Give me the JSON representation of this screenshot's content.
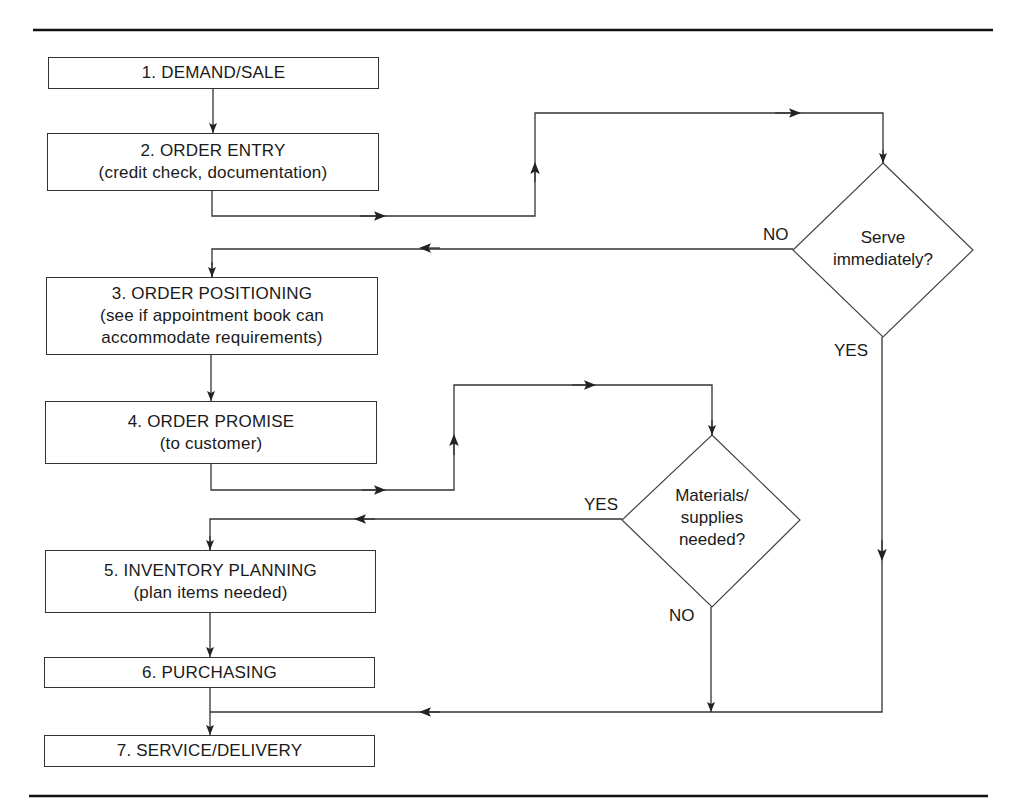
{
  "diagram": {
    "type": "flowchart",
    "steps": [
      {
        "id": 1,
        "title": "1. DEMAND/SALE",
        "subtitle": ""
      },
      {
        "id": 2,
        "title": "2. ORDER ENTRY",
        "subtitle": "(credit check, documentation)"
      },
      {
        "id": 3,
        "title": "3. ORDER POSITIONING",
        "subtitle_line1": "(see if appointment book can",
        "subtitle_line2": "accommodate requirements)"
      },
      {
        "id": 4,
        "title": "4. ORDER PROMISE",
        "subtitle": "(to customer)"
      },
      {
        "id": 5,
        "title": "5. INVENTORY PLANNING",
        "subtitle": "(plan items needed)"
      },
      {
        "id": 6,
        "title": "6. PURCHASING",
        "subtitle": ""
      },
      {
        "id": 7,
        "title": "7. SERVICE/DELIVERY",
        "subtitle": ""
      }
    ],
    "decisions": [
      {
        "id": "serve",
        "line1": "Serve",
        "line2": "immediately?",
        "no_label": "NO",
        "yes_label": "YES"
      },
      {
        "id": "materials",
        "line1": "Materials/",
        "line2": "supplies",
        "line3": "needed?",
        "yes_label": "YES",
        "no_label": "NO"
      }
    ],
    "edges": [
      {
        "from": "1",
        "to": "2"
      },
      {
        "from": "2",
        "to": "serve"
      },
      {
        "from": "serve",
        "to": "3",
        "label": "NO"
      },
      {
        "from": "serve",
        "to": "7",
        "label": "YES"
      },
      {
        "from": "3",
        "to": "4"
      },
      {
        "from": "4",
        "to": "materials"
      },
      {
        "from": "materials",
        "to": "5",
        "label": "YES"
      },
      {
        "from": "materials",
        "to": "7",
        "label": "NO"
      },
      {
        "from": "5",
        "to": "6"
      },
      {
        "from": "6",
        "to": "7"
      }
    ],
    "colors": {
      "line": "#333333",
      "text": "#1a1a1a",
      "background": "#ffffff"
    }
  }
}
